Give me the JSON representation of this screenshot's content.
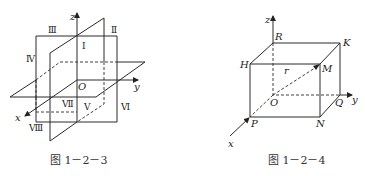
{
  "figures": [
    {
      "caption": "图 1－2－3",
      "axes": {
        "x": "x",
        "y": "y",
        "z": "z",
        "origin": "O"
      },
      "octants": [
        "Ⅰ",
        "Ⅱ",
        "Ⅲ",
        "Ⅳ",
        "Ⅴ",
        "Ⅵ",
        "Ⅶ",
        "Ⅷ"
      ]
    },
    {
      "caption": "图 1－2－4",
      "axes": {
        "x": "x",
        "y": "y",
        "z": "z",
        "origin": "O"
      },
      "vertices": {
        "R": "R",
        "K": "K",
        "H": "H",
        "M": "M",
        "P": "P",
        "N": "N",
        "Q": "Q"
      },
      "vector_label": "r"
    }
  ]
}
